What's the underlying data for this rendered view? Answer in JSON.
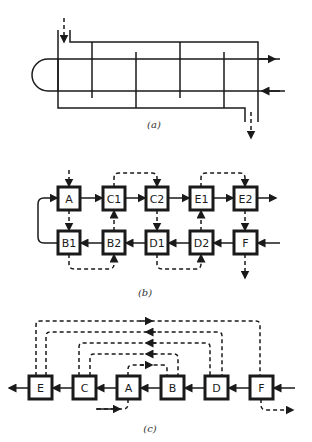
{
  "panels": [
    {
      "id": "a",
      "caption": "(a)",
      "description": "Shell-and-tube heat exchanger with U-tube bundle and baffles"
    },
    {
      "id": "b",
      "caption": "(b)",
      "nodes": [
        "A",
        "C1",
        "C2",
        "E1",
        "E2",
        "B1",
        "B2",
        "D1",
        "D2",
        "F"
      ]
    },
    {
      "id": "c",
      "caption": "(c)",
      "nodes": [
        "E",
        "C",
        "A",
        "B",
        "D",
        "F"
      ]
    }
  ],
  "colors": {
    "line": "#1a1a1a",
    "background": "#ffffff"
  }
}
